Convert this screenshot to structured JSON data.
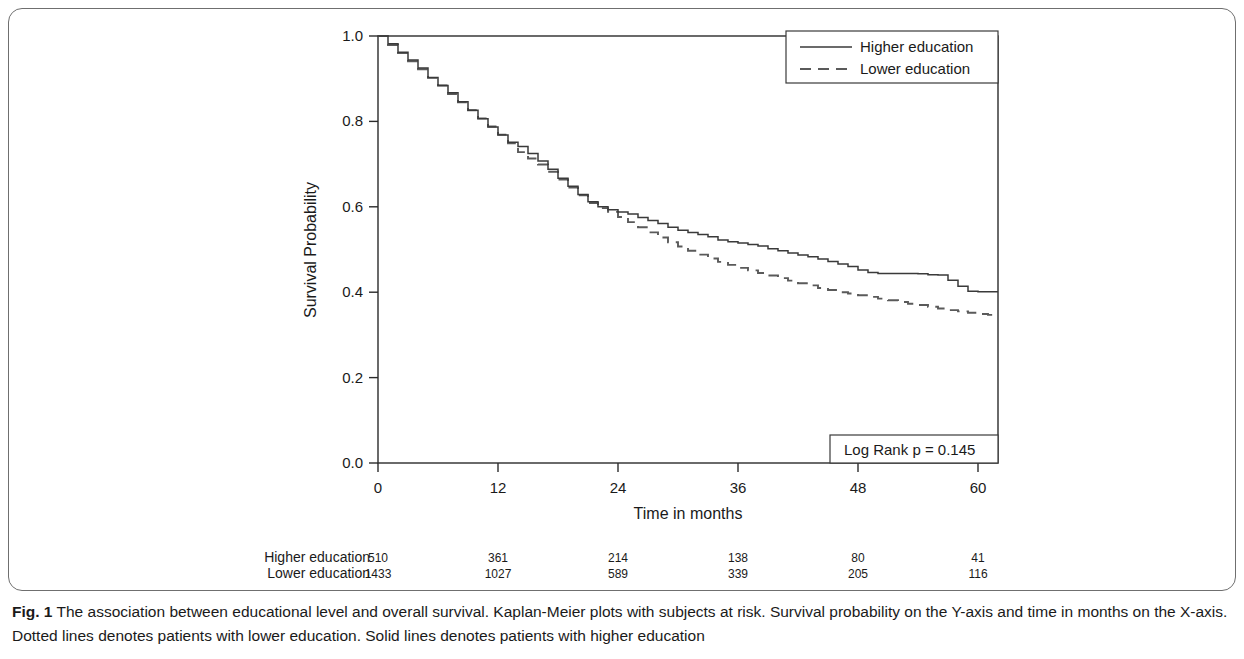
{
  "figure": {
    "label": "Fig. 1",
    "caption": "The association between educational level and overall survival. Kaplan-Meier plots with subjects at risk. Survival probability on the Y-axis and time in months on the X-axis. Dotted lines denotes patients with lower education. Solid lines denotes patients with higher education"
  },
  "annotation": {
    "log_rank": "Log Rank p =  0.145"
  },
  "risk_table": {
    "rows": [
      {
        "label": "Higher education",
        "counts": [
          "510",
          "361",
          "214",
          "138",
          "80",
          "41"
        ]
      },
      {
        "label": "Lower education",
        "counts": [
          "1433",
          "1027",
          "589",
          "339",
          "205",
          "116"
        ]
      }
    ],
    "times": [
      0,
      12,
      24,
      36,
      48,
      60
    ]
  },
  "chart_data": {
    "type": "line",
    "title": "",
    "subtitle": "",
    "xlabel": "Time in months",
    "ylabel": "Survival Probability",
    "xlim": [
      0,
      62
    ],
    "ylim": [
      0.0,
      1.0
    ],
    "xticks": [
      0,
      12,
      24,
      36,
      48,
      60
    ],
    "xticklabels": [
      "0",
      "12",
      "24",
      "36",
      "48",
      "60"
    ],
    "yticks": [
      0.0,
      0.2,
      0.4,
      0.6,
      0.8,
      1.0
    ],
    "yticklabels": [
      "0.0",
      "0.2",
      "0.4",
      "0.6",
      "0.8",
      "1.0"
    ],
    "grid": false,
    "legend_position": "top-right",
    "annotations": [
      "Log Rank p =  0.145"
    ],
    "colors": {
      "higher_education": "#3a3a3a",
      "lower_education": "#5a5a5a"
    },
    "series": [
      {
        "name": "Higher education",
        "style": "solid",
        "x": [
          0,
          1,
          2,
          3,
          4,
          5,
          6,
          7,
          8,
          9,
          10,
          11,
          12,
          13,
          14,
          15,
          16,
          17,
          18,
          19,
          20,
          21,
          22,
          23,
          24,
          25,
          26,
          27,
          28,
          29,
          30,
          31,
          32,
          33,
          34,
          35,
          36,
          37,
          38,
          39,
          40,
          41,
          42,
          43,
          44,
          45,
          46,
          47,
          48,
          49,
          50,
          51,
          52,
          53,
          54,
          55,
          56,
          57,
          58,
          59,
          60,
          61,
          62
        ],
        "values": [
          1.0,
          0.982,
          0.962,
          0.944,
          0.925,
          0.903,
          0.884,
          0.867,
          0.846,
          0.826,
          0.806,
          0.787,
          0.768,
          0.751,
          0.741,
          0.725,
          0.707,
          0.688,
          0.667,
          0.648,
          0.629,
          0.612,
          0.6,
          0.593,
          0.588,
          0.583,
          0.575,
          0.568,
          0.561,
          0.552,
          0.545,
          0.54,
          0.535,
          0.53,
          0.522,
          0.518,
          0.515,
          0.512,
          0.508,
          0.502,
          0.497,
          0.492,
          0.487,
          0.483,
          0.478,
          0.472,
          0.466,
          0.46,
          0.452,
          0.446,
          0.444,
          0.444,
          0.444,
          0.444,
          0.443,
          0.441,
          0.44,
          0.428,
          0.414,
          0.402,
          0.401,
          0.401,
          0.401
        ]
      },
      {
        "name": "Lower education",
        "style": "dashed",
        "x": [
          0,
          1,
          2,
          3,
          4,
          5,
          6,
          7,
          8,
          9,
          10,
          11,
          12,
          13,
          14,
          15,
          16,
          17,
          18,
          19,
          20,
          21,
          22,
          23,
          24,
          25,
          26,
          27,
          28,
          29,
          30,
          31,
          32,
          33,
          34,
          35,
          36,
          37,
          38,
          39,
          40,
          41,
          42,
          43,
          44,
          45,
          46,
          47,
          48,
          49,
          50,
          51,
          52,
          53,
          54,
          55,
          56,
          57,
          58,
          59,
          60,
          61,
          62
        ],
        "values": [
          1.0,
          0.979,
          0.96,
          0.941,
          0.922,
          0.902,
          0.884,
          0.864,
          0.845,
          0.826,
          0.807,
          0.788,
          0.769,
          0.749,
          0.728,
          0.713,
          0.699,
          0.682,
          0.664,
          0.645,
          0.627,
          0.609,
          0.597,
          0.588,
          0.576,
          0.564,
          0.552,
          0.54,
          0.528,
          0.517,
          0.507,
          0.497,
          0.488,
          0.479,
          0.471,
          0.464,
          0.457,
          0.451,
          0.445,
          0.439,
          0.433,
          0.427,
          0.421,
          0.416,
          0.41,
          0.405,
          0.4,
          0.397,
          0.393,
          0.389,
          0.385,
          0.381,
          0.377,
          0.373,
          0.37,
          0.366,
          0.362,
          0.358,
          0.355,
          0.352,
          0.349,
          0.347,
          0.345
        ]
      }
    ]
  }
}
